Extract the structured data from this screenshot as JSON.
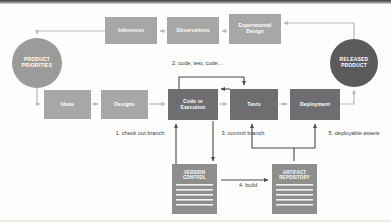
{
  "diagram": {
    "colors": {
      "light_box": "#a7a7a5",
      "dark_box": "#6e6e70",
      "light_circle": "#9b9b99",
      "dark_circle": "#5b5b5d",
      "document_fill": "#8e8e8c",
      "document_line": "#f2f2f0",
      "arrow_light": "#b9b9b7",
      "arrow_dark": "#4a4a4a",
      "label_text": "#3b3b3b",
      "node_text": "#ffffff",
      "background": "#fdfdfc"
    },
    "top_row": [
      {
        "id": "inferences",
        "label": "Inferences",
        "style": "light"
      },
      {
        "id": "observations",
        "label": "Observations",
        "style": "light"
      },
      {
        "id": "experimental-design",
        "label": "Experimental Design",
        "style": "light"
      }
    ],
    "circles": [
      {
        "id": "product-priorities",
        "label": "PRODUCT PRIORITIES",
        "style": "light"
      },
      {
        "id": "released-product",
        "label": "RELEASED PRODUCT",
        "style": "dark"
      }
    ],
    "middle_row": [
      {
        "id": "ideas",
        "label": "Ideas",
        "style": "light"
      },
      {
        "id": "designs",
        "label": "Designs",
        "style": "light"
      },
      {
        "id": "code-or-execution",
        "label": "Code or Execution",
        "style": "dark"
      },
      {
        "id": "tests",
        "label": "Tests",
        "style": "dark"
      },
      {
        "id": "deployment",
        "label": "Deployment",
        "style": "dark"
      }
    ],
    "documents": [
      {
        "id": "version-control",
        "label": "VERSION CONTROL"
      },
      {
        "id": "artifact-repository",
        "label": "ARTIFACT REPOSITORY"
      }
    ],
    "annotations": [
      {
        "id": "step-1",
        "text": "1. check out branch"
      },
      {
        "id": "step-2",
        "text": "2. code, test, code…"
      },
      {
        "id": "step-3",
        "text": "3. commit branch"
      },
      {
        "id": "step-4",
        "text": "4. build"
      },
      {
        "id": "step-5",
        "text": "5. deployable assets"
      }
    ]
  }
}
